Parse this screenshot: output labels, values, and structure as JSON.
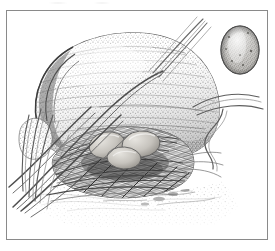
{
  "plate": {
    "title": "Bird nest with eggs beneath a boulder",
    "medium": "pen-and-ink stipple illustration",
    "background_color": "#ffffff",
    "frame": {
      "label": "illustration border",
      "color": "#8a8a8a",
      "left": 6,
      "top": 10,
      "width": 262,
      "height": 230
    }
  },
  "subjects": {
    "boulder": {
      "label": "boulder",
      "description": "large rounded rock with horizontal stippled texture",
      "tone_color": "#9a9a9a",
      "shadow_color": "#5e5e5e"
    },
    "crevice": {
      "label": "rock crevice rim",
      "description": "dark curved rim along the left edge of the boulder",
      "color": "#4f4f4f"
    },
    "nest": {
      "label": "bird nest",
      "description": "woven cup of twigs and dry grasses at the base of the boulder",
      "color": "#555555"
    },
    "nest_eggs": {
      "label": "eggs in nest",
      "count": 3,
      "description": "pale rounded eggs resting in the nest cup",
      "fill_color": "#c9c6c0",
      "outline_color": "#6b6b6b"
    },
    "specimen_egg": {
      "label": "egg specimen",
      "description": "single speckled egg shown separately at upper right",
      "fill_color": "#a8a6a2",
      "highlight_color": "#dedcd8",
      "outline_color": "#5a5a5a",
      "center_x": 240,
      "center_y": 50,
      "width": 38,
      "height": 48
    },
    "grass": {
      "label": "grass blades",
      "description": "long arcing blades sweeping from lower left across the boulder",
      "color": "#6f6f6f"
    },
    "stems": {
      "label": "thin stems",
      "description": "wiry stems curving out to the upper right and mid right",
      "color": "#7a7a7a"
    },
    "ground": {
      "label": "ground litter",
      "description": "lightly stippled soil and debris fading to white at the bottom",
      "color": "#9d9d9d"
    }
  },
  "top_margin_marks": {
    "label": "faint residual marks",
    "description": "barely visible gray traces along the top edge above the frame"
  }
}
